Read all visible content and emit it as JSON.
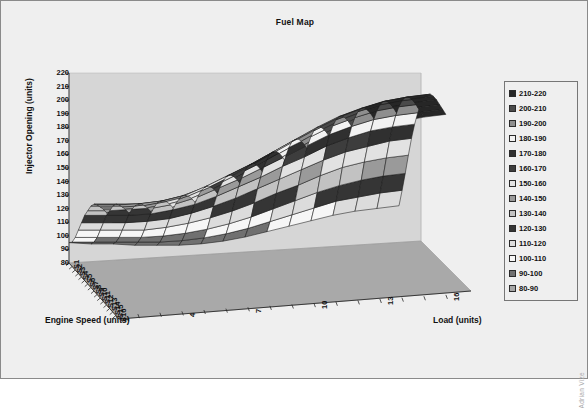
{
  "chart": {
    "title": "Fuel Map",
    "watermark": "Adrian Vize",
    "plot_bg": "#d8d8d8",
    "frame_bg": "#efefef",
    "border_color": "#8a8a8a"
  },
  "axes": {
    "value_axis": {
      "label": "Injector Opening (units)",
      "ticks": [
        220,
        210,
        200,
        190,
        180,
        170,
        160,
        150,
        140,
        130,
        120,
        110,
        100,
        90,
        80
      ],
      "min": 80,
      "max": 220,
      "step": 10
    },
    "category_axis": {
      "label": "Engine Speed (units)",
      "ticks": [
        "S16",
        "S15",
        "S14",
        "S13",
        "S12",
        "S11",
        "S10",
        "S9",
        "S8",
        "S7",
        "S6",
        "S5",
        "S4",
        "S3",
        "S2",
        "S1"
      ]
    },
    "series_axis": {
      "label": "Load (units)",
      "ticks": [
        "1",
        "4",
        "7",
        "10",
        "13",
        "16"
      ],
      "count": 16
    }
  },
  "legend": {
    "position": "right",
    "entries": [
      {
        "label": "210-220",
        "color": "#262626"
      },
      {
        "label": "200-210",
        "color": "#4a4a4a"
      },
      {
        "label": "190-200",
        "color": "#8e8e8e"
      },
      {
        "label": "180-190",
        "color": "#f2f2f2"
      },
      {
        "label": "170-180",
        "color": "#303030"
      },
      {
        "label": "160-170",
        "color": "#3d3d3d"
      },
      {
        "label": "150-160",
        "color": "#e2e2e2"
      },
      {
        "label": "140-150",
        "color": "#9a9a9a"
      },
      {
        "label": "130-140",
        "color": "#c2c2c2"
      },
      {
        "label": "120-130",
        "color": "#353535"
      },
      {
        "label": "110-120",
        "color": "#dcdcdc"
      },
      {
        "label": "100-110",
        "color": "#f6f6f6"
      },
      {
        "label": "90-100",
        "color": "#707070"
      },
      {
        "label": "80-90",
        "color": "#a6a6a6"
      }
    ]
  },
  "chart_data": {
    "type": "surface",
    "title": "Fuel Map",
    "xlabel": "Engine Speed (units)",
    "ylabel": "Injector Opening (units)",
    "zlabel": "Load (units)",
    "ylim": [
      80,
      220
    ],
    "grid": true,
    "legend_position": "right",
    "x_categories": [
      "S1",
      "S2",
      "S3",
      "S4",
      "S5",
      "S6",
      "S7",
      "S8",
      "S9",
      "S10",
      "S11",
      "S12",
      "S13",
      "S14",
      "S15",
      "S16"
    ],
    "z_categories": [
      "1",
      "2",
      "3",
      "4",
      "5",
      "6",
      "7",
      "8",
      "9",
      "10",
      "11",
      "12",
      "13",
      "14",
      "15",
      "16"
    ],
    "band_size": 10,
    "series": [
      {
        "name": "1",
        "values": [
          95,
          98,
          104,
          112,
          120,
          128,
          134,
          140,
          144,
          146,
          147,
          148,
          148,
          147,
          146,
          145
        ]
      },
      {
        "name": "2",
        "values": [
          93,
          97,
          103,
          111,
          119,
          127,
          133,
          139,
          143,
          145,
          146,
          147,
          147,
          146,
          145,
          144
        ]
      },
      {
        "name": "3",
        "values": [
          92,
          96,
          102,
          110,
          118,
          126,
          133,
          138,
          142,
          145,
          146,
          147,
          147,
          146,
          145,
          144
        ]
      },
      {
        "name": "4",
        "values": [
          90,
          95,
          101,
          109,
          118,
          126,
          133,
          139,
          143,
          146,
          148,
          149,
          149,
          148,
          147,
          146
        ]
      },
      {
        "name": "5",
        "values": [
          89,
          94,
          101,
          110,
          119,
          128,
          135,
          141,
          146,
          149,
          151,
          152,
          152,
          151,
          150,
          149
        ]
      },
      {
        "name": "6",
        "values": [
          88,
          94,
          102,
          112,
          122,
          131,
          139,
          146,
          151,
          155,
          157,
          158,
          158,
          157,
          156,
          155
        ]
      },
      {
        "name": "7",
        "values": [
          88,
          95,
          104,
          115,
          126,
          136,
          145,
          152,
          158,
          162,
          164,
          165,
          165,
          164,
          163,
          162
        ]
      },
      {
        "name": "8",
        "values": [
          89,
          97,
          107,
          119,
          131,
          142,
          151,
          159,
          165,
          169,
          172,
          173,
          173,
          172,
          171,
          170
        ]
      },
      {
        "name": "9",
        "values": [
          91,
          100,
          111,
          124,
          137,
          148,
          158,
          166,
          173,
          177,
          180,
          181,
          181,
          180,
          179,
          178
        ]
      },
      {
        "name": "10",
        "values": [
          94,
          104,
          116,
          130,
          143,
          155,
          165,
          174,
          181,
          185,
          188,
          189,
          189,
          188,
          187,
          186
        ]
      },
      {
        "name": "11",
        "values": [
          97,
          108,
          121,
          135,
          149,
          161,
          172,
          181,
          188,
          193,
          196,
          197,
          197,
          196,
          195,
          194
        ]
      },
      {
        "name": "12",
        "values": [
          100,
          112,
          126,
          141,
          155,
          168,
          179,
          188,
          195,
          200,
          203,
          204,
          204,
          203,
          202,
          201
        ]
      },
      {
        "name": "13",
        "values": [
          103,
          116,
          130,
          146,
          160,
          173,
          184,
          193,
          200,
          205,
          208,
          209,
          209,
          208,
          207,
          206
        ]
      },
      {
        "name": "14",
        "values": [
          105,
          118,
          133,
          149,
          163,
          177,
          188,
          197,
          204,
          209,
          212,
          213,
          213,
          212,
          211,
          210
        ]
      },
      {
        "name": "15",
        "values": [
          106,
          120,
          135,
          151,
          166,
          179,
          190,
          199,
          206,
          211,
          214,
          215,
          215,
          214,
          213,
          212
        ]
      },
      {
        "name": "16",
        "values": [
          107,
          121,
          136,
          152,
          167,
          180,
          191,
          200,
          207,
          212,
          215,
          216,
          216,
          215,
          214,
          213
        ]
      }
    ]
  }
}
